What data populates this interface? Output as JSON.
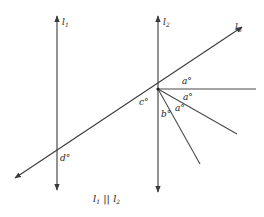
{
  "diagram": {
    "type": "geometry-parallel-lines-transversal",
    "lines": {
      "l1": {
        "name": "l",
        "sub": "1"
      },
      "l2": {
        "name": "l",
        "sub": "2"
      },
      "l3": {
        "name": "l",
        "sub": "3"
      }
    },
    "angles": {
      "a1": "a°",
      "a2": "a°",
      "a3": "a°",
      "b": "b°",
      "c": "c°",
      "d": "d°"
    },
    "caption": {
      "l1": "l",
      "s1": "1",
      "parallel": " || ",
      "l2": "l",
      "s2": "2"
    },
    "colors": {
      "line": "#3a3a3a",
      "text": "#222222",
      "background": "#ffffff"
    }
  }
}
